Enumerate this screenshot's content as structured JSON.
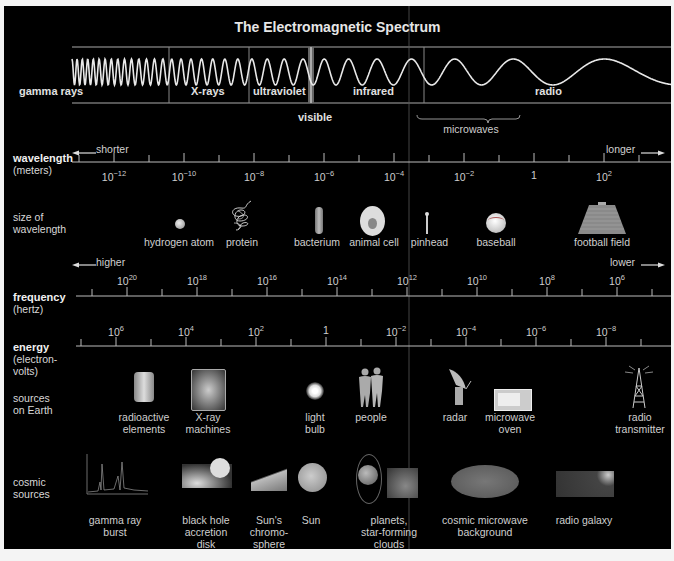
{
  "title": "The Electromagnetic Spectrum",
  "bands": [
    {
      "label": "gamma rays",
      "x": 15
    },
    {
      "label": "X-rays",
      "x": 187
    },
    {
      "label": "ultraviolet",
      "x": 251
    },
    {
      "label": "infrared",
      "x": 349
    },
    {
      "label": "radio",
      "x": 523
    }
  ],
  "visible_label": "visible",
  "microwaves_label": "microwaves",
  "wavelength": {
    "title": "wavelength",
    "unit": "(meters)",
    "shorter": "shorter",
    "longer": "longer",
    "ticks": [
      {
        "base": "10",
        "exp": "−12"
      },
      {
        "base": "10",
        "exp": "−10"
      },
      {
        "base": "10",
        "exp": "−8"
      },
      {
        "base": "10",
        "exp": "−6"
      },
      {
        "base": "10",
        "exp": "−4"
      },
      {
        "base": "10",
        "exp": "−2"
      },
      {
        "base": "1",
        "exp": ""
      },
      {
        "base": "10",
        "exp": "2"
      }
    ]
  },
  "size": {
    "title_line1": "size of",
    "title_line2": "wavelength",
    "items": [
      "hydrogen atom",
      "protein",
      "bacterium",
      "animal cell",
      "pinhead",
      "baseball",
      "football field"
    ]
  },
  "frequency": {
    "title": "frequency",
    "unit": "(hertz)",
    "higher": "higher",
    "lower": "lower",
    "ticks": [
      {
        "base": "10",
        "exp": "20"
      },
      {
        "base": "10",
        "exp": "18"
      },
      {
        "base": "10",
        "exp": "16"
      },
      {
        "base": "10",
        "exp": "14"
      },
      {
        "base": "10",
        "exp": "12"
      },
      {
        "base": "10",
        "exp": "10"
      },
      {
        "base": "10",
        "exp": "8"
      },
      {
        "base": "10",
        "exp": "6"
      }
    ]
  },
  "energy": {
    "title": "energy",
    "unit_line1": "(electron-",
    "unit_line2": "volts)",
    "ticks": [
      {
        "base": "10",
        "exp": "6"
      },
      {
        "base": "10",
        "exp": "4"
      },
      {
        "base": "10",
        "exp": "2"
      },
      {
        "base": "1",
        "exp": ""
      },
      {
        "base": "10",
        "exp": "−2"
      },
      {
        "base": "10",
        "exp": "−4"
      },
      {
        "base": "10",
        "exp": "−6"
      },
      {
        "base": "10",
        "exp": "−8"
      }
    ]
  },
  "earth_sources": {
    "title_line1": "sources",
    "title_line2": "on Earth",
    "items": [
      {
        "line1": "radioactive",
        "line2": "elements"
      },
      {
        "line1": "X-ray",
        "line2": "machines"
      },
      {
        "line1": "light",
        "line2": "bulb"
      },
      {
        "line1": "people",
        "line2": ""
      },
      {
        "line1": "radar",
        "line2": ""
      },
      {
        "line1": "microwave",
        "line2": "oven"
      },
      {
        "line1": "radio",
        "line2": "transmitter"
      }
    ]
  },
  "cosmic_sources": {
    "title_line1": "cosmic",
    "title_line2": "sources",
    "items": [
      {
        "line1": "gamma ray",
        "line2": "burst",
        "line3": ""
      },
      {
        "line1": "black hole",
        "line2": "accretion",
        "line3": "disk"
      },
      {
        "line1": "Sun's",
        "line2": "chromo-",
        "line3": "sphere"
      },
      {
        "line1": "Sun",
        "line2": "",
        "line3": ""
      },
      {
        "line1": "planets,",
        "line2": "star-forming",
        "line3": "clouds"
      },
      {
        "line1": "cosmic microwave",
        "line2": "background",
        "line3": ""
      },
      {
        "line1": "radio galaxy",
        "line2": "",
        "line3": ""
      }
    ]
  },
  "colors": {
    "background": "#000000",
    "frame": "#f4f4f4",
    "text": "#d0d0d0",
    "lines": "#bdbdbd"
  }
}
